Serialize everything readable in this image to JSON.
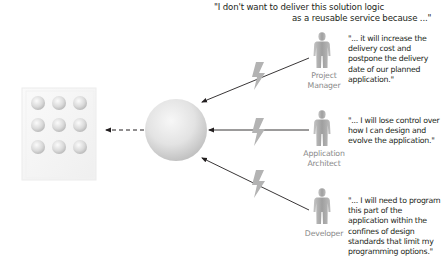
{
  "heading": {
    "line1": "\"I don't want to deliver this solution logic",
    "line2": "as a reusable service because ...\""
  },
  "actors": [
    {
      "role_line1": "Project",
      "role_line2": "Manager",
      "icon": "person-icon",
      "quote": "\"... it will increase the delivery cost and postpone the delivery date of our planned application.\""
    },
    {
      "role_line1": "Application",
      "role_line2": "Architect",
      "icon": "person-icon",
      "quote": "\"... I will lose control over how I can design and evolve the application.\""
    },
    {
      "role_line1": "Developer",
      "role_line2": "",
      "icon": "person-icon",
      "quote": "\"... I will need to program this part of the application within the confines of design standards that limit my programming options.\""
    }
  ],
  "elements": {
    "service_sphere": "sphere-service-icon",
    "application_grid": "application-grid-icon",
    "conflict_markers": "lightning-bolt-icon",
    "grid_rows": 3,
    "grid_cols": 3
  },
  "colors": {
    "text": "#231f20",
    "role_text": "#8a8a8a",
    "arrow": "#231f20",
    "lightning": "#b3b3b3",
    "person": "#a9a9a9",
    "sphere_light": "#f4f4f4",
    "sphere_dark": "#bdbdbd"
  }
}
